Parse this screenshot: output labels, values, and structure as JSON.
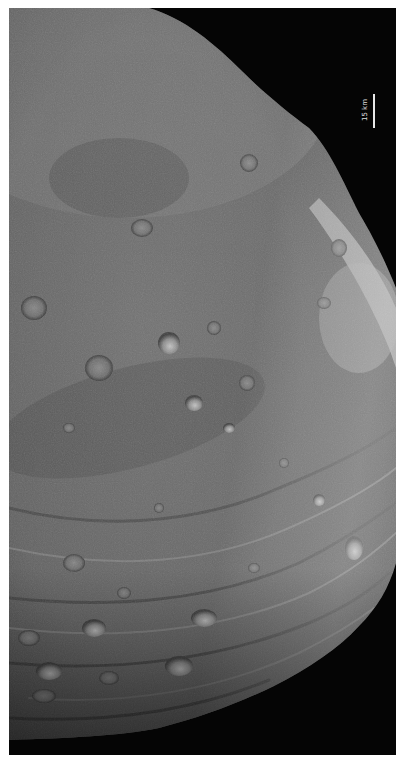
{
  "image": {
    "subject": "asteroid surface (cratered, grayscale)",
    "background_color": "#050505",
    "border_color": "#ffffff"
  },
  "scale_bar": {
    "label": "15 km",
    "orientation": "vertical"
  },
  "colors": {
    "surface_base": "#6e6e6e",
    "surface_dark": "#3a3a3a",
    "surface_bright": "#bdbdbd",
    "space": "#050505"
  }
}
